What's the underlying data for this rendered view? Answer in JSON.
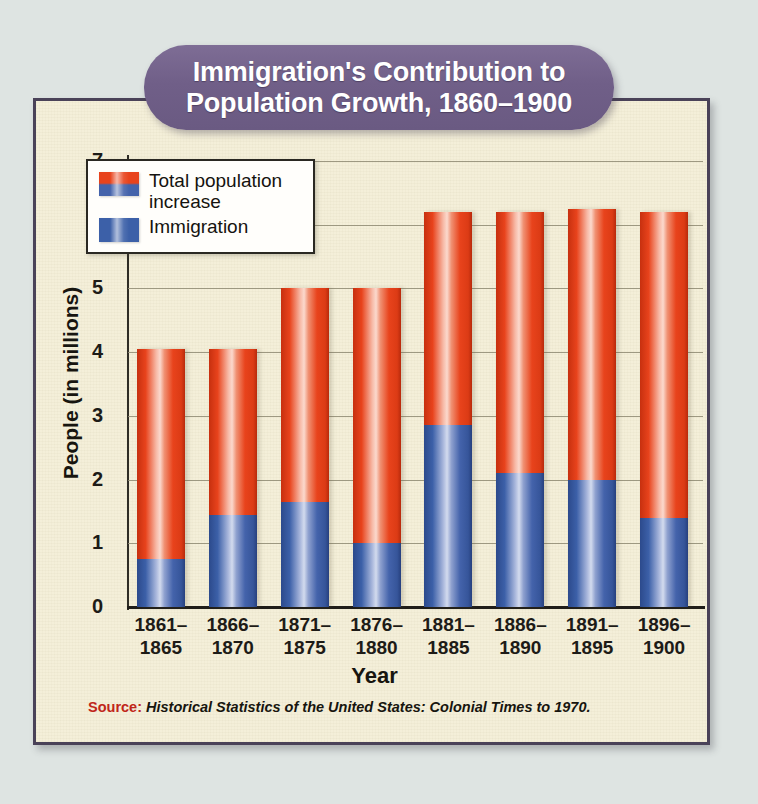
{
  "title": {
    "line1": "Immigration's Contribution to",
    "line2": "Population Growth, 1860–1900"
  },
  "legend": {
    "items": [
      {
        "label": "Total population increase",
        "swatch": "red-blue-swatch"
      },
      {
        "label": "Immigration",
        "swatch": "blue-swatch"
      }
    ]
  },
  "axes": {
    "y_title": "People (in millions)",
    "x_title": "Year",
    "y_ticks": [
      "7",
      "6",
      "5",
      "4",
      "3",
      "2",
      "1",
      "0"
    ]
  },
  "source": {
    "label": "Source:",
    "text": "Historical Statistics of the United States: Colonial Times to 1970."
  },
  "colors": {
    "banner_purple": "#705f88",
    "card_cream": "#f4efd9",
    "page_bg": "#dfe5e3",
    "bar_red": "#e8431c",
    "bar_blue": "#3c60a8",
    "source_red": "#c0261a",
    "border_dark": "#4a4258"
  },
  "chart_data": {
    "type": "bar",
    "subtype": "stacked",
    "title": "Immigration's Contribution to Population Growth, 1860–1900",
    "xlabel": "Year",
    "ylabel": "People (in millions)",
    "ylim": [
      0,
      7
    ],
    "yticks": [
      0,
      1,
      2,
      3,
      4,
      5,
      6,
      7
    ],
    "grid": true,
    "legend_position": "top-left",
    "categories": [
      "1861–1865",
      "1866–1870",
      "1871–1875",
      "1876–1880",
      "1881–1885",
      "1886–1890",
      "1891–1895",
      "1896–1900"
    ],
    "category_lines": [
      [
        "1861–",
        "1865"
      ],
      [
        "1866–",
        "1870"
      ],
      [
        "1871–",
        "1875"
      ],
      [
        "1876–",
        "1880"
      ],
      [
        "1881–",
        "1885"
      ],
      [
        "1886–",
        "1890"
      ],
      [
        "1891–",
        "1895"
      ],
      [
        "1896–",
        "1900"
      ]
    ],
    "series": [
      {
        "name": "Total population increase",
        "color": "#e8431c",
        "values": [
          4.05,
          4.05,
          5.0,
          5.0,
          6.2,
          6.2,
          6.25,
          6.2
        ]
      },
      {
        "name": "Immigration",
        "color": "#3c60a8",
        "values": [
          0.75,
          1.45,
          1.65,
          1.0,
          2.85,
          2.1,
          2.0,
          1.4
        ]
      }
    ]
  }
}
